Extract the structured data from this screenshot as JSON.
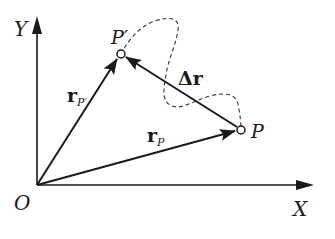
{
  "diagram": {
    "axes": {
      "x_label": "X",
      "y_label": "Y",
      "origin_label": "O"
    },
    "points": {
      "p": "P",
      "p_prime": "P′"
    },
    "vectors": {
      "r_p": {
        "main": "r",
        "sub": "P"
      },
      "r_p_prime": {
        "main": "r",
        "sub": "P′"
      },
      "delta_r": "Δr"
    },
    "path": {
      "style": "dashed",
      "description": "trajectory from P to P′"
    },
    "colors": {
      "ink": "#1a1a1a",
      "background": "#ffffff"
    }
  }
}
